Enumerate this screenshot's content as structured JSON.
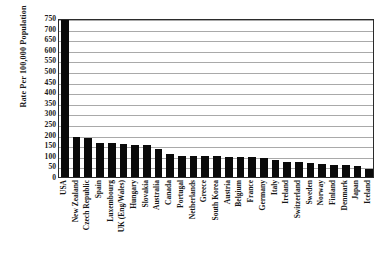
{
  "chart_data": {
    "type": "bar",
    "title": "",
    "subtitle": "",
    "xlabel": "",
    "ylabel": "Rate Per 100,000 Population",
    "ylim": [
      0,
      750
    ],
    "ytick_step": 50,
    "yticks": [
      750,
      700,
      650,
      600,
      550,
      500,
      450,
      400,
      350,
      300,
      250,
      200,
      150,
      100,
      50,
      0
    ],
    "grid": "horizontal",
    "legend": "none",
    "bar_color": "#0a0a0a",
    "categories": [
      "USA",
      "New Zealand",
      "Czech Republic",
      "Spain",
      "Luxembourg",
      "UK (Eng/Wales)",
      "Hungary",
      "Slovakia",
      "Australia",
      "Canada",
      "Portugal",
      "Netherlands",
      "Greece",
      "South Korea",
      "Austria",
      "Belgium",
      "France",
      "Germany",
      "Italy",
      "Ireland",
      "Switzerland",
      "Sweden",
      "Norway",
      "Finland",
      "Denmark",
      "Japan",
      "Iceland"
    ],
    "values": [
      750,
      190,
      186,
      160,
      159,
      156,
      152,
      151,
      131,
      110,
      101,
      100,
      100,
      99,
      96,
      95,
      94,
      91,
      78,
      72,
      71,
      68,
      61,
      56,
      55,
      54,
      37
    ]
  }
}
